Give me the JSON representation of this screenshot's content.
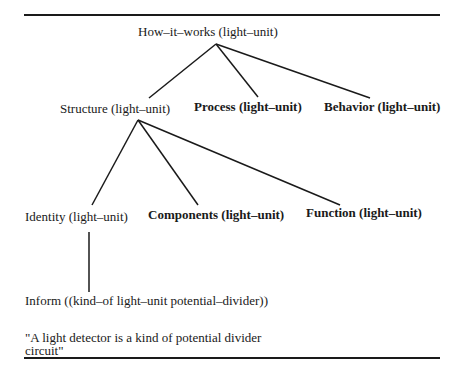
{
  "diagram": {
    "root": {
      "label": "How–it–works (light–unit)"
    },
    "level1": [
      {
        "label": "Structure (light–unit)",
        "bold": false
      },
      {
        "label": "Process (light–unit)",
        "bold": true
      },
      {
        "label": "Behavior (light–unit)",
        "bold": true
      }
    ],
    "level2": [
      {
        "label": "Identity (light–unit)",
        "bold": false
      },
      {
        "label": "Components (light–unit)",
        "bold": true
      },
      {
        "label": "Function (light–unit)",
        "bold": true
      }
    ],
    "level3": {
      "label": "Inform ((kind–of light–unit potential–divider))"
    },
    "gloss": "\"A light detector is a kind of potential divider circuit\""
  }
}
